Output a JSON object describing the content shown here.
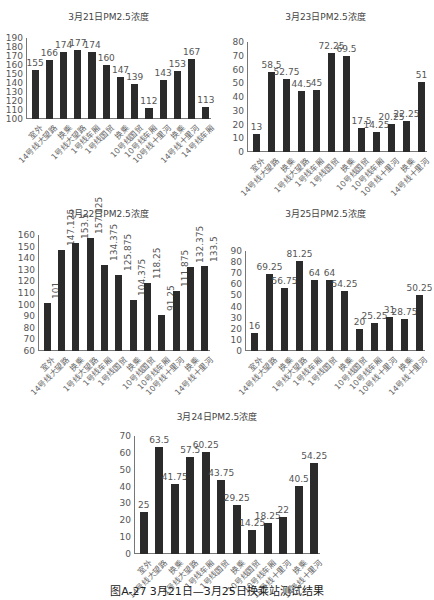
{
  "caption": "图A-27 3月21日—3月25日换乘站测试结果",
  "chart_data": [
    {
      "id": "mar21",
      "type": "bar",
      "title": "3月21日PM2.5浓度",
      "categories": [
        "室外",
        "14号线大望路",
        "换乘",
        "1号线大望路",
        "1号线车厢",
        "1号线国贸",
        "换乘",
        "10号线国贸",
        "10号线车厢",
        "10号线十里河",
        "换乘",
        "14号线十里河",
        "14号线车厢"
      ],
      "values": [
        155,
        166,
        174,
        177,
        174,
        160,
        147,
        139,
        112,
        143,
        153,
        167,
        113
      ],
      "ylim": [
        100,
        190
      ],
      "yticks": [
        100,
        110,
        120,
        130,
        140,
        150,
        160,
        170,
        180,
        190
      ],
      "xlabel": "",
      "ylabel": "",
      "grid": false,
      "legend": "none",
      "label_orientation": "horizontal"
    },
    {
      "id": "mar23",
      "type": "bar",
      "title": "3月23日PM2.5浓度",
      "categories": [
        "室外",
        "14号线大望路",
        "换乘",
        "1号线大望路",
        "1号线车厢",
        "1号线国贸",
        "换乘",
        "10号线国贸",
        "10号线车厢",
        "10号线十里河",
        "换乘",
        "14号线十里河"
      ],
      "values": [
        13,
        58.5,
        52.75,
        44.5,
        45,
        72.25,
        69.5,
        17.5,
        14.25,
        20.25,
        22.25,
        51
      ],
      "ylim": [
        0,
        80
      ],
      "yticks": [
        0,
        10,
        20,
        30,
        40,
        50,
        60,
        70,
        80
      ],
      "xlabel": "",
      "ylabel": "",
      "grid": false,
      "legend": "none",
      "label_orientation": "horizontal"
    },
    {
      "id": "mar22",
      "type": "bar",
      "title": "3月22日PM2.5浓度",
      "categories": [
        "室外",
        "14号线大望路",
        "换乘",
        "1号线大望路",
        "1号线车厢",
        "1号线国贸",
        "换乘",
        "10号线国贸",
        "10号线车厢",
        "10号线十里河",
        "换乘",
        "14号线十里河"
      ],
      "values": [
        101,
        147.125,
        153.5,
        157.125,
        134.375,
        125.875,
        104.375,
        118.25,
        91.25,
        111.875,
        132.375,
        133.5
      ],
      "ylim": [
        60,
        160
      ],
      "yticks": [
        60,
        70,
        80,
        90,
        100,
        110,
        120,
        130,
        140,
        150,
        160
      ],
      "xlabel": "",
      "ylabel": "",
      "grid": false,
      "legend": "none",
      "label_orientation": "vertical"
    },
    {
      "id": "mar25",
      "type": "bar",
      "title": "3月25日PM2.5浓度",
      "categories": [
        "室外",
        "14号线大望路",
        "换乘",
        "1号线大望路",
        "1号线车厢",
        "1号线国贸",
        "换乘",
        "10号线国贸",
        "10号线车厢",
        "10号线十里河",
        "换乘",
        "14号线十里河"
      ],
      "values": [
        16,
        69.25,
        56.75,
        81.25,
        64,
        64,
        54.25,
        20,
        25.25,
        31,
        28.75,
        50.25
      ],
      "ylim": [
        0,
        90
      ],
      "yticks": [
        0,
        10,
        20,
        30,
        40,
        50,
        60,
        70,
        80,
        90
      ],
      "xlabel": "",
      "ylabel": "",
      "grid": false,
      "legend": "none",
      "label_orientation": "horizontal"
    },
    {
      "id": "mar24",
      "type": "bar",
      "title": "3月24日PM2.5浓度",
      "categories": [
        "室外",
        "14号线大望路",
        "换乘",
        "1号线大望路",
        "1号线车厢",
        "1号线国贸",
        "换乘",
        "10号线国贸",
        "10号线车厢",
        "10号线十里河",
        "换乘",
        "14号线十里河"
      ],
      "values": [
        25,
        63.5,
        41.75,
        57.5,
        60.25,
        43.75,
        29.25,
        14.25,
        18.25,
        22,
        40.5,
        54.25
      ],
      "ylim": [
        0,
        70
      ],
      "yticks": [
        0,
        10,
        20,
        30,
        40,
        50,
        60,
        70
      ],
      "xlabel": "",
      "ylabel": "",
      "grid": false,
      "legend": "none",
      "label_orientation": "horizontal"
    }
  ],
  "layout": {
    "bar_color": "#2b2b2b",
    "charts": [
      {
        "left": 0,
        "top": 0,
        "width": 217,
        "title_top": 10,
        "plot_left": 26,
        "plot_top": 38,
        "plot_w": 185,
        "plot_h": 81
      },
      {
        "left": 217,
        "top": 0,
        "width": 217,
        "title_top": 10,
        "plot_left": 30,
        "plot_top": 42,
        "plot_w": 180,
        "plot_h": 110
      },
      {
        "left": 0,
        "top": 195,
        "width": 217,
        "title_top": 12,
        "plot_left": 38,
        "plot_top": 40,
        "plot_w": 172,
        "plot_h": 116
      },
      {
        "left": 217,
        "top": 195,
        "width": 217,
        "title_top": 12,
        "plot_left": 28,
        "plot_top": 56,
        "plot_w": 180,
        "plot_h": 100
      },
      {
        "left": 100,
        "top": 400,
        "width": 234,
        "title_top": 10,
        "plot_left": 34,
        "plot_top": 36,
        "plot_w": 186,
        "plot_h": 118
      }
    ]
  }
}
